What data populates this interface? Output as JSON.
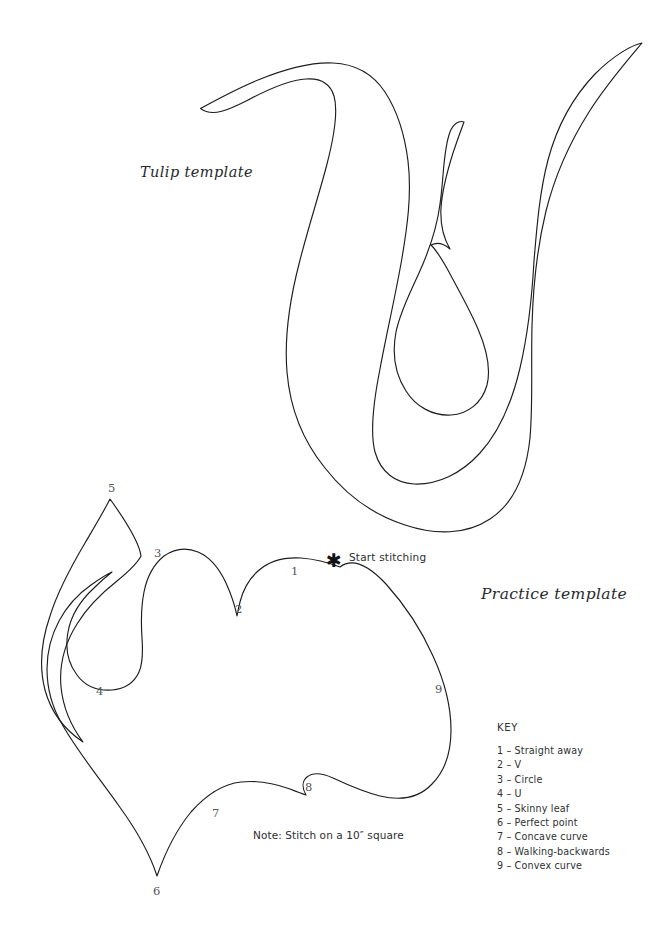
{
  "page": {
    "background_color": "#ffffff",
    "ink_color": "#1b1d1f",
    "width": 669,
    "height": 933
  },
  "titles": {
    "tulip": "Tulip template",
    "practice": "Practice template"
  },
  "annotations": {
    "start_stitching": "Start stitching",
    "start_marker_glyph": "✱",
    "note": "Note: Stitch on a 10″ square"
  },
  "numbered_points": [
    {
      "label": "1",
      "x": 291,
      "y": 564
    },
    {
      "label": "2",
      "x": 235,
      "y": 602
    },
    {
      "label": "3",
      "x": 154,
      "y": 546
    },
    {
      "label": "4",
      "x": 96,
      "y": 684
    },
    {
      "label": "5",
      "x": 108,
      "y": 481
    },
    {
      "label": "6",
      "x": 153,
      "y": 884
    },
    {
      "label": "7",
      "x": 212,
      "y": 806
    },
    {
      "label": "8",
      "x": 305,
      "y": 780
    },
    {
      "label": "9",
      "x": 435,
      "y": 682
    }
  ],
  "key": {
    "title": "KEY",
    "items": [
      "1 – Straight away",
      "2 – V",
      "3 – Circle",
      "4 – U",
      "5 – Skinny leaf",
      "6 – Perfect point",
      "7 – Concave curve",
      "8 – Walking-backwards",
      "9 – Convex curve"
    ]
  },
  "shapes": {
    "tulip_outer": "M 200.5 108.5 C 215 101 232 92 252 83 C 281 70 313 61 337 63 C 360 65 376 76 388 93 C 402 112 409 137 411 160 C 414 192 409 224 404 253 C 397 292 388 330 381 364 C 373 402 369 433 374 452 C 379 470 391 478 407 479 C 428 480 450 470 468 452 C 487 433 500 405 509 372 C 518 338 522 300 525 264 C 528 226 530 190 536 159 C 543 125 556 97 576 77 C 597 57 622 46 641 42.5 C 622 62 601 86 583 113 C 563 143 547 176 537 212 C 527 249 523 289 522 328 C 521 367 523 404 520 437 C 516 472 505 499 484 513 C 463 527 434 527 406 518 C 377 509 351 491 331 466 C 311 441 298 410 295 375 C 292 341 298 305 306 271 C 315 236 326 203 334 171 C 342 139 346 112 342 96 C 338 82 327 76 311 77 C 293 78 271 88 251 99 C 231 110 214 120 200.5 108.5 Z",
    "tulip_inner": "M 461 126 C 458 135 453 147 449 160 C 443 179 439 198 439 213 C 439 229 443 241 449 252 C 442 246 435 244 429 246 C 436 253 441 262 447 272 C 457 290 468 308 476 325 C 485 345 489 364 485 380 C 481 397 468 408 452 410 C 435 412 418 404 407 389 C 396 374 392 353 396 333 C 399 314 408 295 417 275 C 426 253 434 230 437 207 C 441 181 440 155 446 137 C 449 128 455 124 461 126 Z",
    "heart_main": "M 332 564 C 322 561 311 558 299 557 C 283 556 268 559 257 568 C 248 575 242 585 238 597 C 236 605 235 610 235 610 C 233 601 229 590 224 580 C 217 566 208 556 197 551 C 186 546 174 547 165 553 C 155 560 148 572 145 587 C 142 601 142 617 143 632 C 144 647 145 659 141 669 C 137 680 127 686 115 688 C 101 690 87 685 78 675 C 68 664 64 648 67 632 C 70 616 79 601 92 589 C 102 579 112 570 112 570 C 106 573 99 577 92 582 C 79 591 68 603 60 617 C 52 632 48 648 48 665 C 48 684 53 702 62 719 C 76 745 98 773 118 801 C 134 823 148 847 157 874 C 166 848 177 827 191 810 C 205 793 222 782 240 780 C 258 778 275 782 289 787 C 299 791 305 793 305 793 C 301 786 301 779 306 775 C 312 770 321 771 332 776 C 346 782 362 790 378 794 C 398 799 416 796 430 783 C 443 771 449 752 449 731 C 449 707 442 682 432 658 C 420 631 403 606 385 586 C 368 568 350 557 332 564 Z",
    "heart_leaf": "M 110 498 C 104 510 95 525 85 542 C 71 565 57 591 48 618 C 39 645 37 671 44 694 C 50 716 65 734 83 745 C 70 728 62 708 60 687 C 58 664 65 641 77 622 C 89 603 105 589 120 578 C 135 567 149 558 110 498 Z"
  }
}
